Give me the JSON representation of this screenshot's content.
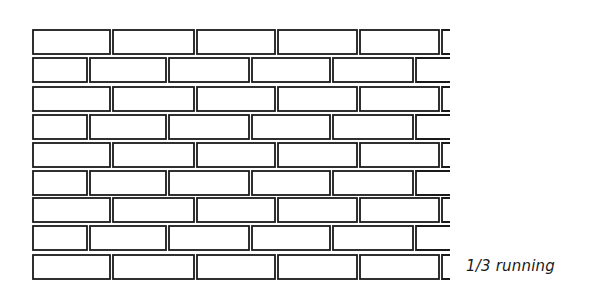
{
  "diagram": {
    "caption": "1/3 running",
    "bond_type": "running bond, one-third offset",
    "rows": 9,
    "stroke_color": "#1a1a1a",
    "fill_color": "#ffffff",
    "wall": {
      "left": 33,
      "right": 450,
      "row_tops": [
        30,
        58,
        87,
        115,
        143,
        171,
        198,
        226,
        255
      ],
      "row_height": 24,
      "odd_row_joints": [
        33,
        110,
        194,
        275,
        357,
        439
      ],
      "even_row_joints": [
        33,
        87,
        166,
        249,
        330,
        413
      ]
    }
  }
}
